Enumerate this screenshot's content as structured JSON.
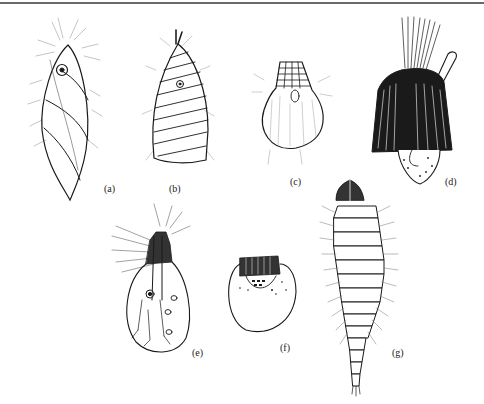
{
  "figure": {
    "panels": [
      {
        "id": "a",
        "label": "(a)",
        "subject": "spirally-banded larval case with hairs"
      },
      {
        "id": "b",
        "label": "(b)",
        "subject": "transversely ringed conical case"
      },
      {
        "id": "c",
        "label": "(c)",
        "subject": "rounded case with banded anterior"
      },
      {
        "id": "d",
        "label": "(d)",
        "subject": "densely striated case with fan of filaments and tube"
      },
      {
        "id": "e",
        "label": "(e)",
        "subject": "oval body with hairy anterior and internal structures"
      },
      {
        "id": "f",
        "label": "(f)",
        "subject": "globular body with banded head"
      },
      {
        "id": "g",
        "label": "(g)",
        "subject": "segmented elongate larva"
      }
    ]
  }
}
